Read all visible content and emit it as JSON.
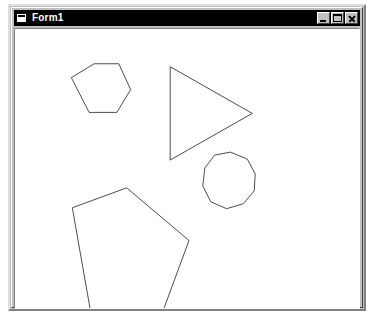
{
  "window": {
    "title": "Form1",
    "icon": "form-window-icon",
    "background_color": "#c0c0c0",
    "client_background_color": "#ffffff",
    "titlebar_color": "#000000",
    "titlebar_text_color": "#ffffff",
    "buttons": [
      {
        "name": "minimize",
        "label": "Minimize",
        "glyph": "minimize-icon"
      },
      {
        "name": "maximize",
        "label": "Maximize",
        "glyph": "maximize-icon"
      },
      {
        "name": "close",
        "label": "Close",
        "glyph": "close-icon"
      }
    ]
  },
  "drawing": {
    "stroke_color": "#4d4d4d",
    "stroke_width": 1,
    "viewbox": "0 0 348 281",
    "shapes": [
      {
        "name": "hexagon",
        "sides": 6,
        "label": "Hexagon",
        "points": "57,49 80,35 105,35 117,61 103,84 75,84"
      },
      {
        "name": "triangle",
        "sides": 3,
        "label": "Triangle",
        "points": "157,38 240,85 157,132"
      },
      {
        "name": "nonagon",
        "sides": 9,
        "label": "Nonagon",
        "points": "202,127 218,124 235,131 243,146 242,163 231,176 214,181 198,174 190,158 192,140"
      },
      {
        "name": "pentagon",
        "sides": 5,
        "label": "Pentagon",
        "points": "58,180 113,160 176,213 149,286 76,282"
      }
    ]
  }
}
